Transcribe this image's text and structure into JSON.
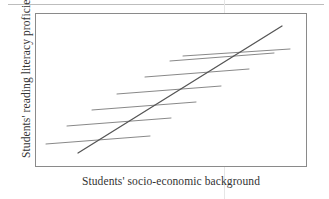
{
  "figure": {
    "xlabel": "Students' socio-economic background",
    "ylabel": "Students' reading literacy proficiency"
  },
  "colors": {
    "frame": "#8a8a8a",
    "within_line": "#7b7b7b",
    "between_line": "#555555",
    "text": "#333333",
    "scan_artifact": "#e6e6e6",
    "background": "#ffffff"
  },
  "chart_data": {
    "type": "line",
    "title": "",
    "xlabel": "Students' socio-economic background",
    "ylabel": "Students' reading literacy proficiency",
    "xlim": [
      0,
      272
    ],
    "ylim": [
      0,
      154
    ],
    "grid": false,
    "legend": null,
    "axis_ticks": {
      "x": [],
      "y": []
    },
    "series": [
      {
        "name": "within-school gradient 1",
        "kind": "segment",
        "x": [
          11,
          115
        ],
        "y": [
          131,
          123
        ]
      },
      {
        "name": "within-school gradient 2",
        "kind": "segment",
        "x": [
          32,
          136
        ],
        "y": [
          113,
          105
        ]
      },
      {
        "name": "within-school gradient 3",
        "kind": "segment",
        "x": [
          57,
          161
        ],
        "y": [
          97,
          89
        ]
      },
      {
        "name": "within-school gradient 4",
        "kind": "segment",
        "x": [
          82,
          186
        ],
        "y": [
          81,
          73
        ]
      },
      {
        "name": "within-school gradient 5",
        "kind": "segment",
        "x": [
          110,
          214
        ],
        "y": [
          64,
          56
        ]
      },
      {
        "name": "within-school gradient 6",
        "kind": "segment",
        "x": [
          135,
          239
        ],
        "y": [
          48,
          40
        ]
      },
      {
        "name": "within-school gradient 7",
        "kind": "segment",
        "x": [
          148,
          255
        ],
        "y": [
          43,
          36
        ]
      },
      {
        "name": "between-school gradient",
        "kind": "trend",
        "x": [
          43,
          247
        ],
        "y": [
          140,
          13
        ]
      }
    ]
  }
}
